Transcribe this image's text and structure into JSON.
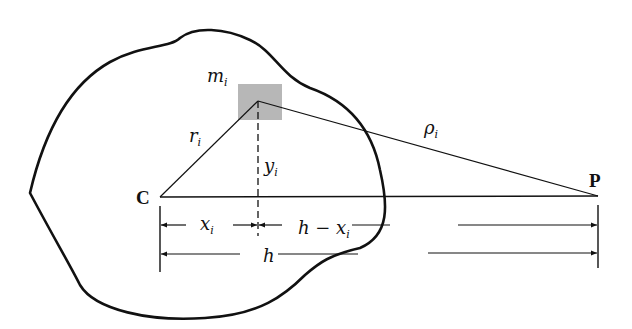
{
  "diagram": {
    "title": "",
    "colors": {
      "ink": "#111111",
      "mass_element": "#aaaaaa"
    },
    "points": {
      "center": "C",
      "external": "P"
    },
    "labels": {
      "mass": {
        "base": "m",
        "sub": "i"
      },
      "r": {
        "base": "r",
        "sub": "i"
      },
      "rho": {
        "base": "ρ",
        "sub": "i"
      },
      "y": {
        "base": "y",
        "sub": "i"
      },
      "x": {
        "base": "x",
        "sub": "i"
      },
      "h_minus_x": {
        "base": "h − x",
        "sub": "i"
      },
      "h": "h"
    }
  }
}
